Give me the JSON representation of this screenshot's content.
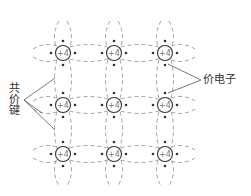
{
  "diagram": {
    "atoms": {
      "charge_label": "+4",
      "columns_x": [
        63,
        114,
        165
      ],
      "rows_y": [
        53,
        105,
        154
      ],
      "radius": 7.5
    },
    "labels": {
      "covalent_bond": "共价键",
      "valence_electron": "价电子"
    },
    "colors": {
      "line": "#666666",
      "dashed": "#888888",
      "electron": "#333333",
      "text": "#333333"
    }
  }
}
